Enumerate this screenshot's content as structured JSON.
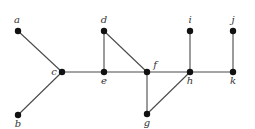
{
  "graph": {
    "nodes": [
      {
        "id": "a",
        "label": "a",
        "x": 18,
        "y": 31,
        "lx": 17,
        "ly": 23
      },
      {
        "id": "b",
        "label": "b",
        "x": 18,
        "y": 115,
        "lx": 18,
        "ly": 127
      },
      {
        "id": "c",
        "label": "c",
        "x": 62,
        "y": 72,
        "lx": 54,
        "ly": 75
      },
      {
        "id": "d",
        "label": "d",
        "x": 104,
        "y": 31,
        "lx": 104,
        "ly": 23
      },
      {
        "id": "e",
        "label": "e",
        "x": 104,
        "y": 72,
        "lx": 104,
        "ly": 84
      },
      {
        "id": "f",
        "label": "f",
        "x": 147,
        "y": 72,
        "lx": 155,
        "ly": 68
      },
      {
        "id": "g",
        "label": "g",
        "x": 147,
        "y": 114,
        "lx": 147,
        "ly": 126
      },
      {
        "id": "h",
        "label": "h",
        "x": 190,
        "y": 72,
        "lx": 190,
        "ly": 84
      },
      {
        "id": "i",
        "label": "i",
        "x": 190,
        "y": 31,
        "lx": 190,
        "ly": 23
      },
      {
        "id": "j",
        "label": "j",
        "x": 233,
        "y": 31,
        "lx": 233,
        "ly": 23
      },
      {
        "id": "k",
        "label": "k",
        "x": 233,
        "y": 72,
        "lx": 233,
        "ly": 84
      }
    ],
    "edges": [
      [
        "a",
        "c"
      ],
      [
        "b",
        "c"
      ],
      [
        "c",
        "e"
      ],
      [
        "e",
        "d"
      ],
      [
        "d",
        "f"
      ],
      [
        "e",
        "f"
      ],
      [
        "f",
        "h"
      ],
      [
        "f",
        "g"
      ],
      [
        "g",
        "h"
      ],
      [
        "h",
        "i"
      ],
      [
        "h",
        "k"
      ],
      [
        "k",
        "j"
      ]
    ]
  }
}
